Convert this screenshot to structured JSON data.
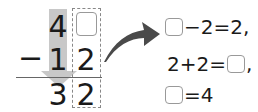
{
  "problem": {
    "type": "vertical-subtraction",
    "minuend": {
      "tens": "4",
      "ones": ""
    },
    "operator": "−",
    "subtrahend": {
      "tens": "1",
      "ones": "2"
    },
    "difference": {
      "tens": "3",
      "ones": "2"
    }
  },
  "equations": [
    {
      "parts": [
        "",
        "−2=2,"
      ]
    },
    {
      "parts": [
        "2+2=",
        ","
      ]
    },
    {
      "parts": [
        "",
        "=4"
      ]
    }
  ],
  "colors": {
    "gray_arrow": "#c8c8c8",
    "curved_arrow": "#4a4a4a",
    "box_border": "#999999",
    "dashed_border": "#888888"
  }
}
